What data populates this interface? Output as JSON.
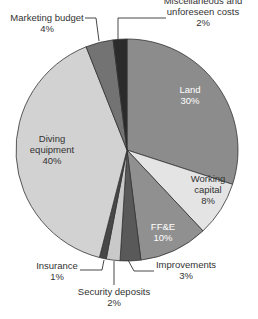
{
  "chart_data": {
    "type": "pie",
    "title": "",
    "start_angle_deg": 0,
    "direction": "clockwise",
    "center": [
      127,
      150
    ],
    "radius": 111,
    "slices": [
      {
        "name": "Land",
        "value": 30,
        "label": "30%",
        "color": "#8c8c8c",
        "label_pos": [
          190,
          95
        ],
        "label_lines": [
          "Land",
          "30%"
        ],
        "label_color": "#ffffff",
        "inside": true
      },
      {
        "name": "Working capital",
        "value": 8,
        "label": "8%",
        "color": "#e4e4e4",
        "label_pos": [
          208,
          190
        ],
        "label_lines": [
          "Working",
          "capital",
          "8%"
        ],
        "label_color": "#333333",
        "inside": true
      },
      {
        "name": "FF&E",
        "value": 10,
        "label": "10%",
        "color": "#909090",
        "label_pos": [
          163,
          232
        ],
        "label_lines": [
          "FF&E",
          "10%"
        ],
        "label_color": "#ffffff",
        "inside": true
      },
      {
        "name": "Improvements",
        "value": 3,
        "label": "3%",
        "color": "#595959",
        "label_pos": [
          186,
          270
        ],
        "label_lines": [
          "Improvements",
          "3%"
        ],
        "label_color": "#333333",
        "inside": false,
        "leader": [
          [
            128,
            260
          ],
          [
            134,
            271
          ],
          [
            154,
            271
          ]
        ]
      },
      {
        "name": "Security deposits",
        "value": 2,
        "label": "2%",
        "color": "#c9c9c9",
        "label_pos": [
          114,
          297
        ],
        "label_lines": [
          "Security deposits",
          "2%"
        ],
        "label_color": "#333333",
        "inside": false,
        "leader": [
          [
            114,
            261
          ],
          [
            114,
            285
          ]
        ]
      },
      {
        "name": "Insurance",
        "value": 1,
        "label": "1%",
        "color": "#474747",
        "label_pos": [
          57,
          271
        ],
        "label_lines": [
          "Insurance",
          "1%"
        ],
        "label_color": "#333333",
        "inside": false,
        "leader": [
          [
            104,
            260
          ],
          [
            102,
            270
          ],
          [
            80,
            270
          ]
        ]
      },
      {
        "name": "Diving equipment",
        "value": 40,
        "label": "40%",
        "color": "#d2d2d2",
        "label_pos": [
          52,
          150
        ],
        "label_lines": [
          "Diving",
          "equipment",
          "40%"
        ],
        "label_color": "#333333",
        "inside": true
      },
      {
        "name": "Marketing budget",
        "value": 4,
        "label": "4%",
        "color": "#737373",
        "label_pos": [
          47,
          23
        ],
        "label_lines": [
          "Marketing budget",
          "4%"
        ],
        "label_color": "#333333",
        "inside": false,
        "leader": [
          [
            85,
            18
          ],
          [
            96,
            18
          ],
          [
            99,
            41
          ]
        ]
      },
      {
        "name": "Miscellaneous and unforeseen costs",
        "value": 2,
        "label": "2%",
        "color": "#2b2b2b",
        "label_pos": [
          203,
          12
        ],
        "label_lines": [
          "Miscellaneous and",
          "unforeseen costs",
          "2%"
        ],
        "label_color": "#333333",
        "inside": false,
        "leader": [
          [
            166,
            18
          ],
          [
            118,
            18
          ],
          [
            118,
            40
          ]
        ]
      }
    ],
    "legend": null,
    "grid": false
  }
}
